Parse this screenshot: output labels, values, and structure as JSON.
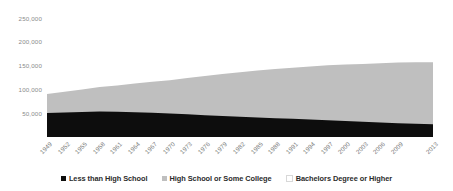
{
  "chart_data": {
    "type": "area",
    "stacked": true,
    "title": "",
    "subtitle": "",
    "xlabel": "",
    "ylabel": "",
    "grid": false,
    "legend_position": "bottom",
    "ylim": [
      0,
      270000
    ],
    "yticks": [
      50000,
      100000,
      150000,
      200000,
      250000
    ],
    "ytick_labels": [
      "50,000",
      "100,000",
      "150,000",
      "200,000",
      "250,000"
    ],
    "x": [
      1949,
      1952,
      1955,
      1958,
      1961,
      1964,
      1967,
      1970,
      1973,
      1976,
      1979,
      1982,
      1985,
      1988,
      1991,
      1994,
      1997,
      2000,
      2003,
      2006,
      2009,
      2012,
      2013
    ],
    "xtick_labels": [
      "1949",
      "1952",
      "1955",
      "1958",
      "1961",
      "1964",
      "1967",
      "1970",
      "1973",
      "1976",
      "1979",
      "1982",
      "1985",
      "1988",
      "1991",
      "1994",
      "1997",
      "2000",
      "2003",
      "2006",
      "2009",
      "2012",
      "2013"
    ],
    "xtick_display": [
      "1949",
      "1952",
      "1955",
      "1958",
      "1961",
      "1964",
      "1967",
      "1970",
      "1973",
      "1976",
      "1979",
      "1982",
      "1985",
      "1988",
      "1991",
      "1994",
      "1997",
      "2000",
      "2003",
      "2006",
      "2009",
      "2013"
    ],
    "series": [
      {
        "name": "Less than High School",
        "color": "#0d0d0d",
        "values": [
          50000,
          51500,
          52500,
          53500,
          53000,
          52000,
          50500,
          49000,
          47500,
          45500,
          44000,
          42500,
          41000,
          39500,
          38000,
          36500,
          35000,
          33500,
          32000,
          30500,
          29000,
          27500,
          26500
        ]
      },
      {
        "name": "High School or Some College",
        "color": "#bfbfbf",
        "values": [
          40000,
          43000,
          47000,
          51000,
          55000,
          60000,
          65000,
          70000,
          76000,
          82000,
          88000,
          93000,
          98000,
          103000,
          107000,
          111000,
          115000,
          118000,
          121000,
          124000,
          127000,
          129000,
          130000
        ]
      },
      {
        "name": "Bachelors Degree or Higher",
        "color": "#ffffff",
        "values": [
          8000,
          9000,
          10000,
          11000,
          12500,
          14000,
          16000,
          18000,
          21000,
          24000,
          27000,
          30000,
          33000,
          36000,
          39000,
          42000,
          45000,
          48000,
          51000,
          54000,
          57000,
          60000,
          62000
        ]
      }
    ]
  },
  "axis": {
    "ytick_color": "#8a8a8a",
    "xtick_color": "#7a7a7a"
  },
  "legend": {
    "items": [
      {
        "label": "Less than High School",
        "color": "#0d0d0d"
      },
      {
        "label": "High School or Some College",
        "color": "#bfbfbf"
      },
      {
        "label": "Bachelors Degree or Higher",
        "color": "#ffffff"
      }
    ]
  }
}
